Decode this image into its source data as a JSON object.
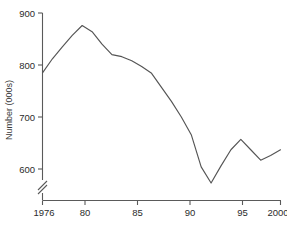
{
  "chart_data": {
    "type": "line",
    "title": "",
    "xlabel": "",
    "ylabel": "Number (000s)",
    "xlim": [
      1976,
      2000
    ],
    "ylim": [
      570,
      900
    ],
    "ytick_values": [
      600,
      700,
      800,
      900
    ],
    "ytick_labels": [
      "600",
      "700",
      "800",
      "900"
    ],
    "xtick_values": [
      1976,
      1980,
      1985,
      1990,
      1995,
      2000
    ],
    "xtick_labels": [
      "1976",
      "80",
      "85",
      "90",
      "95",
      "2000"
    ],
    "grid": false,
    "legend": null,
    "axis_break": {
      "axis": "y",
      "symbol": "//",
      "note": "y-axis broken below 600"
    },
    "x": [
      1976,
      1977,
      1978,
      1979,
      1980,
      1981,
      1982,
      1983,
      1984,
      1985,
      1986,
      1987,
      1988,
      1989,
      1990,
      1991,
      1992,
      1993,
      1994,
      1995,
      1996,
      1997,
      1998,
      1999,
      2000
    ],
    "values": [
      785,
      812,
      835,
      857,
      876,
      864,
      840,
      820,
      816,
      808,
      797,
      784,
      757,
      730,
      700,
      666,
      604,
      573,
      606,
      637,
      657,
      637,
      617,
      626,
      637
    ],
    "series": [
      {
        "name": "Number (000s)",
        "color": "#555555",
        "values": [
          785,
          812,
          835,
          857,
          876,
          864,
          840,
          820,
          816,
          808,
          797,
          784,
          757,
          730,
          700,
          666,
          604,
          573,
          606,
          637,
          657,
          637,
          617,
          626,
          637
        ]
      }
    ]
  },
  "axes": {
    "y_axis_title": "Number (000s)",
    "y_ticks": [
      "900",
      "800",
      "700",
      "600"
    ],
    "x_ticks": [
      "1976",
      "80",
      "85",
      "90",
      "95",
      "2000"
    ]
  }
}
